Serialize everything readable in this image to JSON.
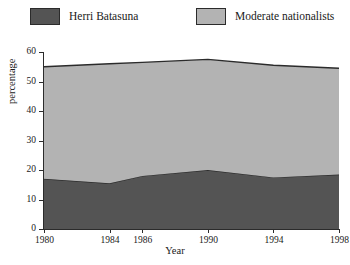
{
  "chart_data": {
    "type": "area",
    "stacked": true,
    "title": "",
    "xlabel": "Year",
    "ylabel": "percentage",
    "x": [
      1980,
      1984,
      1986,
      1990,
      1994,
      1998
    ],
    "categories": [
      "1980",
      "1984",
      "1986",
      "1990",
      "1994",
      "1998"
    ],
    "series": [
      {
        "name": "Herri Batasuna",
        "color": "#545454",
        "values": [
          17.0,
          15.5,
          18.0,
          20.0,
          17.5,
          18.5
        ]
      },
      {
        "name": "Moderate nationalists",
        "color": "#b3b3b3",
        "values": [
          38.0,
          40.5,
          38.5,
          37.5,
          38.0,
          36.0
        ]
      }
    ],
    "totals": [
      55.0,
      56.0,
      56.5,
      57.5,
      55.5,
      54.5
    ],
    "xlim": [
      1980,
      1998
    ],
    "ylim": [
      0,
      60
    ],
    "yticks": [
      0,
      10,
      20,
      30,
      40,
      50,
      60
    ],
    "ytick_labels": [
      "0",
      "10",
      "20",
      "30",
      "40",
      "50",
      "60"
    ],
    "xticks": [
      1980,
      1984,
      1986,
      1990,
      1994,
      1998
    ],
    "xtick_labels": [
      "1980",
      "1984",
      "1986",
      "1990",
      "1994",
      "1998"
    ],
    "grid": false,
    "legend_position": "top"
  },
  "legend": {
    "items": [
      {
        "label": "Herri Batasuna",
        "color": "#545454"
      },
      {
        "label": "Moderate nationalists",
        "color": "#b3b3b3"
      }
    ]
  },
  "colors": {
    "herri_batasuna": "#545454",
    "moderate_nationalists": "#b3b3b3",
    "axis": "#2b2b2b",
    "background": "#ffffff"
  }
}
